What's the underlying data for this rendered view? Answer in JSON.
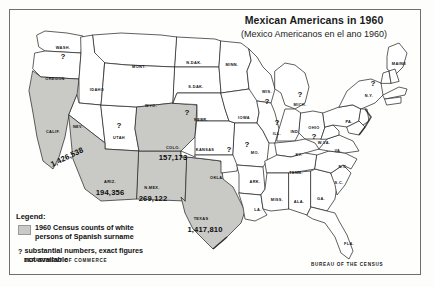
{
  "map": {
    "title": "Mexican Americans in 1960",
    "subtitle": "(Mexico Americanos en el ano 1960)"
  },
  "legend": {
    "heading": "Legend:",
    "swatch_color": "#c9c9c6",
    "swatch_text_line1": "1960 Census counts of white",
    "swatch_text_line2": "persons of Spanish surname",
    "qmark_symbol": "?",
    "qmark_text_line1": "substantial numbers, exact figures",
    "qmark_text_line2": "not available"
  },
  "credits": {
    "department": "DEPARTMENT OF COMMERCE",
    "bureau": "BUREAU OF THE CENSUS"
  },
  "chart_data": {
    "type": "map",
    "title": "Mexican Americans in 1960",
    "subtitle": "(Mexico Americanos en el ano 1960)",
    "measure": "1960 Census counts of white persons of Spanish surname",
    "region": "United States",
    "shaded_states": [
      "CALIF.",
      "ARIZ.",
      "N.MEX.",
      "COLO.",
      "TEXAS"
    ],
    "values": [
      {
        "state": "CALIF.",
        "value": 1426538,
        "label": "1,426,538"
      },
      {
        "state": "COLO.",
        "value": 157173,
        "label": "157,173"
      },
      {
        "state": "ARIZ.",
        "value": 194356,
        "label": "194,356"
      },
      {
        "state": "N.MEX.",
        "value": 269122,
        "label": "269,122"
      },
      {
        "state": "TEXAS",
        "value": 1417810,
        "label": "1,417,810"
      }
    ],
    "unavailable_states": [
      "WASH.",
      "UTAH",
      "NEBR.",
      "KANSAS",
      "MO.",
      "ILL.",
      "WIS.",
      "MICH.",
      "OHIO",
      "N.Y."
    ]
  },
  "states": [
    {
      "abbr": "WASH.",
      "x": 54,
      "y": 38,
      "q": {
        "x": 54,
        "y": 47
      }
    },
    {
      "abbr": "OREGON",
      "x": 46,
      "y": 69,
      "q": null
    },
    {
      "abbr": "CALIF.",
      "x": 44,
      "y": 122,
      "q": null
    },
    {
      "abbr": "IDAHO",
      "x": 88,
      "y": 80,
      "q": null
    },
    {
      "abbr": "NEV.",
      "x": 69,
      "y": 117,
      "q": null
    },
    {
      "abbr": "UTAH",
      "x": 110,
      "y": 128,
      "q": {
        "x": 110,
        "y": 116
      }
    },
    {
      "abbr": "MONT.",
      "x": 130,
      "y": 57,
      "q": null
    },
    {
      "abbr": "WYO.",
      "x": 142,
      "y": 96,
      "q": null
    },
    {
      "abbr": "ARIZ.",
      "x": 101,
      "y": 172,
      "q": null
    },
    {
      "abbr": "COLO.",
      "x": 164,
      "y": 138,
      "q": null
    },
    {
      "abbr": "N.MEX.",
      "x": 143,
      "y": 178,
      "q": null
    },
    {
      "abbr": "N.DAK.",
      "x": 185,
      "y": 53,
      "q": null
    },
    {
      "abbr": "S.DAK.",
      "x": 187,
      "y": 77,
      "q": null
    },
    {
      "abbr": "NEBR.",
      "x": 192,
      "y": 110,
      "q": {
        "x": 178,
        "y": 103
      }
    },
    {
      "abbr": "KANSAS",
      "x": 196,
      "y": 140,
      "q": {
        "x": 220,
        "y": 140
      }
    },
    {
      "abbr": "OKLA.",
      "x": 208,
      "y": 168,
      "q": null
    },
    {
      "abbr": "TEXAS",
      "x": 192,
      "y": 209,
      "q": null
    },
    {
      "abbr": "MINN.",
      "x": 223,
      "y": 55,
      "q": null
    },
    {
      "abbr": "IOWA",
      "x": 235,
      "y": 108,
      "q": null
    },
    {
      "abbr": "MO.",
      "x": 246,
      "y": 143,
      "q": {
        "x": 238,
        "y": 135
      }
    },
    {
      "abbr": "ARK.",
      "x": 246,
      "y": 172,
      "q": null
    },
    {
      "abbr": "LA.",
      "x": 249,
      "y": 200,
      "q": null
    },
    {
      "abbr": "WIS.",
      "x": 258,
      "y": 82,
      "q": {
        "x": 258,
        "y": 92
      }
    },
    {
      "abbr": "ILL.",
      "x": 268,
      "y": 124,
      "q": {
        "x": 268,
        "y": 113
      }
    },
    {
      "abbr": "MICH.",
      "x": 291,
      "y": 95,
      "q": {
        "x": 291,
        "y": 85
      }
    },
    {
      "abbr": "IND.",
      "x": 286,
      "y": 122,
      "q": null
    },
    {
      "abbr": "OHIO",
      "x": 305,
      "y": 118,
      "q": {
        "x": 305,
        "y": 127
      }
    },
    {
      "abbr": "KY.",
      "x": 290,
      "y": 145,
      "q": null
    },
    {
      "abbr": "TENN.",
      "x": 287,
      "y": 163,
      "q": null
    },
    {
      "abbr": "MISS.",
      "x": 268,
      "y": 190,
      "q": null
    },
    {
      "abbr": "ALA.",
      "x": 290,
      "y": 192,
      "q": null
    },
    {
      "abbr": "GA.",
      "x": 312,
      "y": 189,
      "q": null
    },
    {
      "abbr": "FLA.",
      "x": 340,
      "y": 234,
      "q": null
    },
    {
      "abbr": "S.C.",
      "x": 330,
      "y": 173,
      "q": null
    },
    {
      "abbr": "N.C.",
      "x": 334,
      "y": 157,
      "q": null
    },
    {
      "abbr": "VA.",
      "x": 329,
      "y": 141,
      "q": null
    },
    {
      "abbr": "W.VA.",
      "x": 315,
      "y": 133,
      "q": null
    },
    {
      "abbr": "PA.",
      "x": 340,
      "y": 112,
      "q": null
    },
    {
      "abbr": "N.Y.",
      "x": 360,
      "y": 86,
      "q": {
        "x": 364,
        "y": 74
      }
    },
    {
      "abbr": "MAINE",
      "x": 390,
      "y": 54,
      "q": null
    }
  ],
  "state_values": [
    {
      "state": "CALIF.",
      "label": "1,426,538",
      "x": 58,
      "y": 148,
      "rotated": true
    },
    {
      "state": "COLO.",
      "label": "157,173",
      "x": 164,
      "y": 148,
      "rotated": false
    },
    {
      "state": "ARIZ.",
      "label": "194,356",
      "x": 101,
      "y": 183,
      "rotated": false
    },
    {
      "state": "N.MEX.",
      "label": "269,122",
      "x": 144,
      "y": 189,
      "rotated": false
    },
    {
      "state": "TEXAS",
      "label": "1,417,810",
      "x": 196,
      "y": 220,
      "rotated": false
    }
  ]
}
